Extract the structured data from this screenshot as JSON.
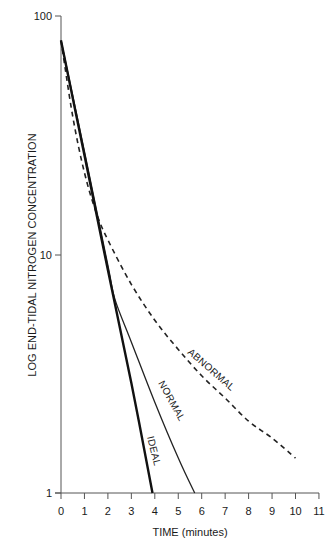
{
  "chart_data": {
    "type": "line",
    "title": "",
    "xlabel": "TIME (minutes)",
    "ylabel": "LOG END-TIDAL NITROGEN CONCENTRATION",
    "xlim": [
      0,
      11
    ],
    "ylim": [
      1,
      100
    ],
    "yscale": "log",
    "grid": false,
    "legend": "none (inline curve labels)",
    "x_ticks": [
      "0",
      "1",
      "2",
      "3",
      "4",
      "5",
      "6",
      "7",
      "8",
      "9",
      "10",
      "11"
    ],
    "y_ticks": [
      "1",
      "10",
      "100"
    ],
    "series": [
      {
        "name": "IDEAL",
        "style": "solid-bold",
        "x": [
          0,
          1,
          2,
          3,
          3.9
        ],
        "y": [
          79,
          26,
          8.6,
          2.9,
          1.0
        ]
      },
      {
        "name": "NORMAL",
        "style": "solid",
        "x": [
          0,
          1,
          2,
          2.3,
          3,
          4,
          5,
          5.7
        ],
        "y": [
          79,
          27,
          9,
          6.5,
          4.3,
          2.4,
          1.4,
          1.0
        ]
      },
      {
        "name": "ABNORMAL",
        "style": "dashed",
        "x": [
          0,
          0.5,
          1,
          1.5,
          2,
          3,
          4,
          5,
          6,
          7,
          8,
          9,
          10
        ],
        "y": [
          79,
          38,
          22,
          15,
          11.5,
          7.5,
          5.3,
          4.0,
          3.1,
          2.5,
          2.0,
          1.7,
          1.4
        ]
      }
    ],
    "annotations": [
      "IDEAL",
      "NORMAL",
      "ABNORMAL"
    ]
  },
  "labels": {
    "x_axis_title": "TIME (minutes)",
    "y_axis_title": "LOG  END-TIDAL  NITROGEN  CONCENTRATION",
    "ideal": "IDEAL",
    "normal": "NORMAL",
    "abnormal": "ABNORMAL",
    "x_ticks": [
      "0",
      "1",
      "2",
      "3",
      "4",
      "5",
      "6",
      "7",
      "8",
      "9",
      "10",
      "11"
    ],
    "y_ticks": {
      "t1": "1",
      "t10": "10",
      "t100": "100"
    }
  }
}
